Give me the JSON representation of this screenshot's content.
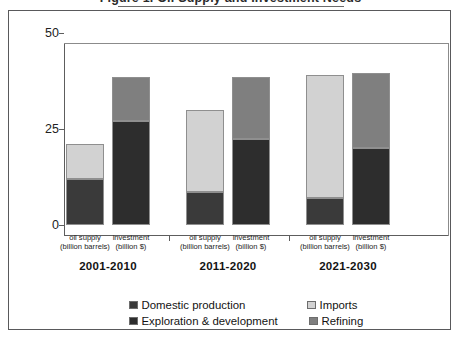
{
  "figure": {
    "title": "Figure 1. Oil Supply and Investment Needs"
  },
  "chart_data": {
    "type": "bar",
    "subtype": "stacked-bar-grouped",
    "title": "Figure 1. Oil Supply and Investment Needs",
    "xlabel": "",
    "ylabel": "",
    "ylim": [
      0,
      50
    ],
    "yticks": [
      0,
      25,
      50
    ],
    "ytick_labels": [
      "0",
      "25",
      "50"
    ],
    "grid": false,
    "legend_position": "bottom",
    "categories": [
      "2001-2010",
      "2011-2020",
      "2021-2030"
    ],
    "bar_types": [
      {
        "key": "oil_supply",
        "line1": "oil supply",
        "line2": "(billion barrels)"
      },
      {
        "key": "investment",
        "line1": "investment",
        "line2": "(billion $)"
      }
    ],
    "series": [
      {
        "name": "Domestic production",
        "stack": "oil supply",
        "color": "#3a3a3a",
        "values": [
          12,
          8.5,
          7
        ]
      },
      {
        "name": "Imports",
        "stack": "oil supply",
        "color": "#d2d2d2",
        "values": [
          9,
          21.5,
          32
        ]
      },
      {
        "name": "Exploration & development",
        "stack": "investment",
        "color": "#2d2d2d",
        "values": [
          27,
          22.5,
          20
        ]
      },
      {
        "name": "Refining",
        "stack": "investment",
        "color": "#7f7f7f",
        "values": [
          11.5,
          16,
          19.5
        ]
      }
    ],
    "bars": [
      {
        "group": "2001-2010",
        "type": "oil supply",
        "caption_line1": "oil supply",
        "caption_line2": "(billion barrels)",
        "total": 21,
        "segments": [
          {
            "name": "Domestic production",
            "value": 12,
            "color": "#3a3a3a"
          },
          {
            "name": "Imports",
            "value": 9,
            "color": "#d2d2d2"
          }
        ]
      },
      {
        "group": "2001-2010",
        "type": "investment",
        "caption_line1": "investment",
        "caption_line2": "(billion $)",
        "total": 38.5,
        "segments": [
          {
            "name": "Exploration & development",
            "value": 27,
            "color": "#2d2d2d"
          },
          {
            "name": "Refining",
            "value": 11.5,
            "color": "#7f7f7f"
          }
        ]
      },
      {
        "group": "2011-2020",
        "type": "oil supply",
        "caption_line1": "oil supply",
        "caption_line2": "(billion barrels)",
        "total": 30,
        "segments": [
          {
            "name": "Domestic production",
            "value": 8.5,
            "color": "#3a3a3a"
          },
          {
            "name": "Imports",
            "value": 21.5,
            "color": "#d2d2d2"
          }
        ]
      },
      {
        "group": "2011-2020",
        "type": "investment",
        "caption_line1": "investment",
        "caption_line2": "(billion $)",
        "total": 38.5,
        "segments": [
          {
            "name": "Exploration & development",
            "value": 22.5,
            "color": "#2d2d2d"
          },
          {
            "name": "Refining",
            "value": 16,
            "color": "#7f7f7f"
          }
        ]
      },
      {
        "group": "2021-2030",
        "type": "oil supply",
        "caption_line1": "oil supply",
        "caption_line2": "(billion barrels)",
        "total": 39,
        "segments": [
          {
            "name": "Domestic production",
            "value": 7,
            "color": "#3a3a3a"
          },
          {
            "name": "Imports",
            "value": 32,
            "color": "#d2d2d2"
          }
        ]
      },
      {
        "group": "2021-2030",
        "type": "investment",
        "caption_line1": "investment",
        "caption_line2": "(billion $)",
        "total": 39.5,
        "segments": [
          {
            "name": "Exploration & development",
            "value": 20,
            "color": "#2d2d2d"
          },
          {
            "name": "Refining",
            "value": 19.5,
            "color": "#7f7f7f"
          }
        ]
      }
    ],
    "legend": [
      {
        "label": "Domestic production",
        "color": "#3a3a3a"
      },
      {
        "label": "Imports",
        "color": "#d2d2d2"
      },
      {
        "label": "Exploration & development",
        "color": "#2d2d2d"
      },
      {
        "label": "Refining",
        "color": "#7f7f7f"
      }
    ]
  }
}
